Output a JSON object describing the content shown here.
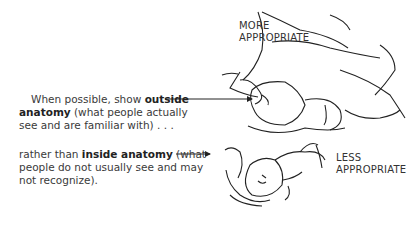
{
  "captions": {
    "outside": {
      "pre": "When possible, show ",
      "bold": "outside",
      "bold2": "anatomy",
      "post": " (what people actually see and are familiar with) . . ."
    },
    "inside": {
      "pre": "rather than ",
      "bold": "inside anatomy",
      "post": " (what people do not usually see and may not recognize)."
    }
  },
  "labels": {
    "more_line1": "MORE",
    "more_line2": "APPROPRIATE",
    "less_line1": "LESS",
    "less_line2": "APPROPRIATE"
  },
  "illustrations": {
    "top": "outside-anatomy-birth-drawing",
    "bottom": "inside-anatomy-baby-drawing"
  }
}
